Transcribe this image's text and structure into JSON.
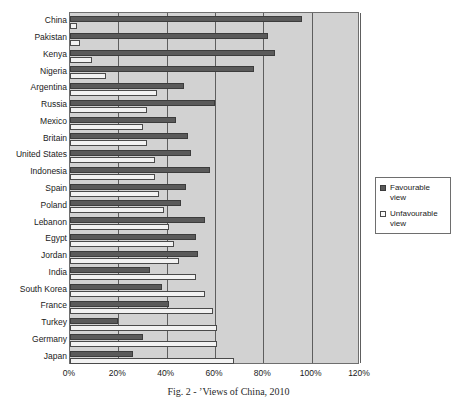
{
  "chart_data": {
    "type": "bar",
    "orientation": "horizontal",
    "title": "",
    "xlabel": "",
    "ylabel": "",
    "xlim": [
      0,
      120
    ],
    "xticks": [
      "0%",
      "20%",
      "40%",
      "60%",
      "80%",
      "100%",
      "120%"
    ],
    "xtick_values": [
      0,
      20,
      40,
      60,
      80,
      100,
      120
    ],
    "grid": true,
    "legend_position": "right",
    "categories": [
      "China",
      "Pakistan",
      "Kenya",
      "Nigeria",
      "Argentina",
      "Russia",
      "Mexico",
      "Britain",
      "United States",
      "Indonesia",
      "Spain",
      "Poland",
      "Lebanon",
      "Egypt",
      "Jordan",
      "India",
      "South Korea",
      "France",
      "Turkey",
      "Germany",
      "Japan"
    ],
    "series": [
      {
        "name": "Favourable view",
        "color": "#5a5a5a",
        "values": [
          96,
          82,
          85,
          76,
          47,
          60,
          44,
          49,
          50,
          58,
          48,
          46,
          56,
          52,
          53,
          33,
          38,
          41,
          20,
          30,
          26
        ]
      },
      {
        "name": "Unfavourable view",
        "color": "#f2f2f2",
        "values": [
          3,
          4,
          9,
          15,
          36,
          32,
          30,
          32,
          35,
          35,
          37,
          39,
          41,
          43,
          45,
          52,
          56,
          59,
          61,
          61,
          68
        ]
      }
    ]
  },
  "legend": {
    "items": [
      {
        "label": "Favourable view",
        "swatch": "favourable-swatch"
      },
      {
        "label": "Unfavourable view",
        "swatch": "unfavourable-swatch"
      }
    ]
  },
  "caption": {
    "text": "Fig. 2 - ’Views of China, 2010"
  }
}
